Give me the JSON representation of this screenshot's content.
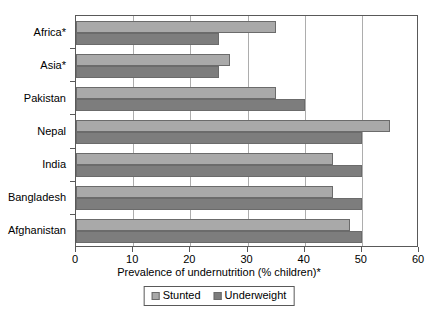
{
  "chart_data": {
    "type": "bar",
    "orientation": "horizontal",
    "title": "",
    "xlabel": "Prevalence of undernutrition (% children)*",
    "ylabel": "",
    "xlim": [
      0,
      60
    ],
    "xticks": [
      0,
      10,
      20,
      30,
      40,
      50,
      60
    ],
    "xtick_labels": [
      "0",
      "10",
      "20",
      "30",
      "40",
      "50",
      "60"
    ],
    "grid": "vertical",
    "legend_position": "bottom-center",
    "categories": [
      "Africa*",
      "Asia*",
      "Pakistan",
      "Nepal",
      "India",
      "Bangladesh",
      "Afghanistan"
    ],
    "series": [
      {
        "name": "Stunted",
        "color": "#a9a9a9",
        "values": [
          35,
          27,
          35,
          55,
          45,
          45,
          48
        ]
      },
      {
        "name": "Underweight",
        "color": "#7d7d7d",
        "values": [
          25,
          25,
          40,
          50,
          50,
          50,
          50
        ]
      }
    ]
  },
  "legend": {
    "items": [
      {
        "label": "Stunted"
      },
      {
        "label": "Underweight"
      }
    ]
  },
  "axis": {
    "x_title": "Prevalence of undernutrition (% children)*"
  }
}
